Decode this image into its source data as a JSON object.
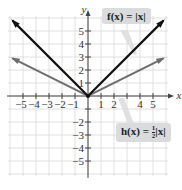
{
  "chart_data": {
    "type": "line",
    "title": "",
    "xlabel": "x",
    "ylabel": "y",
    "xlim": [
      -6,
      6
    ],
    "ylim": [
      -6,
      6
    ],
    "grid": true,
    "x_ticks": [
      -5,
      -4,
      -3,
      -2,
      -1,
      1,
      2,
      4,
      5
    ],
    "x_tick_labels": [
      "−5",
      "−4",
      "−3",
      "−2",
      "−1",
      "1",
      "2",
      "4",
      "5"
    ],
    "y_ticks": [
      5,
      4,
      3,
      2,
      1,
      -2,
      -3,
      -4,
      -5
    ],
    "y_tick_labels": [
      "5",
      "4",
      "3",
      "2",
      "1",
      "−2",
      "−3",
      "−4",
      "−5"
    ],
    "series": [
      {
        "name": "f(x) = |x|",
        "color": "#111111",
        "x": [
          -5.8,
          0,
          5.8
        ],
        "y": [
          5.8,
          0,
          5.8
        ]
      },
      {
        "name": "h(x) = 1/2|x|",
        "color": "#6e6e6e",
        "x": [
          -5.8,
          0,
          5.8
        ],
        "y": [
          2.9,
          0,
          2.9
        ]
      }
    ],
    "annotations": [
      {
        "text": "f(x) = |x|",
        "target_series": "f(x) = |x|"
      },
      {
        "text": "h(x) = 1/2|x|",
        "target_series": "h(x) = 1/2|x|"
      }
    ]
  },
  "labels": {
    "f_prefix": "f(x) = |x|",
    "h_prefix": "h(x) = ",
    "h_num": "1",
    "h_den": "2",
    "h_suffix": "|x|",
    "x_axis": "x",
    "y_axis": "y"
  },
  "colors": {
    "grid": "#d8d8d8",
    "axis": "#444444",
    "f_line": "#111111",
    "h_line": "#6e6e6e",
    "label_bg": "#d9dbdc",
    "pointer": "#e0e0e0"
  }
}
